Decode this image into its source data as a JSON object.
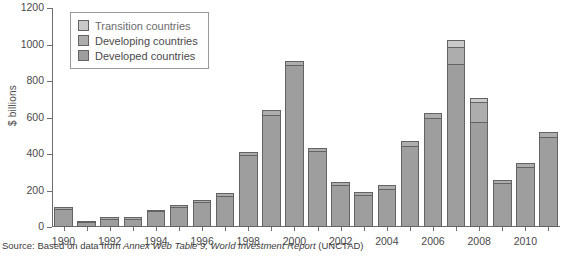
{
  "chart_data": {
    "type": "bar",
    "stacked": true,
    "title": "",
    "xlabel": "",
    "ylabel": "$ billions",
    "ylim": [
      0,
      1200
    ],
    "yticks": [
      0,
      200,
      400,
      600,
      800,
      1000,
      1200
    ],
    "grid": false,
    "legend_position": "upper-left-inside",
    "categories": [
      "1990",
      "1991",
      "1992",
      "1993",
      "1994",
      "1995",
      "1996",
      "1997",
      "1998",
      "1999",
      "2000",
      "2001",
      "2002",
      "2003",
      "2004",
      "2005",
      "2006",
      "2007",
      "2008",
      "2009",
      "2010",
      "2011"
    ],
    "xtick_labels": [
      "1990",
      "1992",
      "1994",
      "1996",
      "1998",
      "2000",
      "2002",
      "2004",
      "2006",
      "2008",
      "2010"
    ],
    "series": [
      {
        "name": "Developed countries",
        "color": "#9e9e9e",
        "values": [
          95,
          22,
          40,
          40,
          80,
          105,
          130,
          165,
          390,
          610,
          880,
          410,
          225,
          170,
          205,
          440,
          590,
          890,
          570,
          235,
          325,
          490
        ]
      },
      {
        "name": "Developing countries",
        "color": "#adadad",
        "values": [
          10,
          5,
          8,
          8,
          8,
          10,
          12,
          15,
          15,
          25,
          25,
          15,
          18,
          15,
          18,
          25,
          30,
          90,
          110,
          15,
          22,
          25
        ]
      },
      {
        "name": "Transition countries",
        "color": "#c9c9c9",
        "values": [
          0,
          0,
          0,
          0,
          0,
          0,
          0,
          0,
          0,
          0,
          0,
          0,
          0,
          0,
          0,
          0,
          0,
          40,
          20,
          0,
          0,
          0
        ]
      }
    ],
    "totals": [
      105,
      27,
      48,
      48,
      88,
      115,
      142,
      180,
      405,
      635,
      905,
      425,
      243,
      185,
      223,
      465,
      620,
      1020,
      700,
      250,
      347,
      515
    ]
  },
  "legend": {
    "items": [
      {
        "label": "Transition countries"
      },
      {
        "label": "Developing countries"
      },
      {
        "label": "Developed countries"
      }
    ]
  },
  "axis": {
    "y_title": "$ billions"
  },
  "source": {
    "prefix": "Source: Based on data from ",
    "italic": "Annex Web Table 9, World Investment Report",
    "suffix": " (UNCTAD)"
  }
}
